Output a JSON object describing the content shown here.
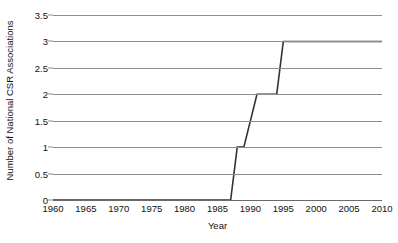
{
  "chart_data": {
    "type": "line",
    "title": "",
    "subtitle": "",
    "xlabel": "Year",
    "ylabel": "Number of National CSR Associations",
    "xlim": [
      1960,
      2010
    ],
    "ylim": [
      0,
      3.5
    ],
    "grid": true,
    "legend": null,
    "legend_position": "none",
    "step_style": "linear-segments",
    "xticks": [
      1960,
      1965,
      1970,
      1975,
      1980,
      1985,
      1990,
      1995,
      2000,
      2005,
      2010
    ],
    "xtick_labels": [
      "1960",
      "1965",
      "1970",
      "1975",
      "1980",
      "1985",
      "1990",
      "1995",
      "2000",
      "2005",
      "2010"
    ],
    "yticks": [
      0,
      0.5,
      1,
      1.5,
      2,
      2.5,
      3,
      3.5
    ],
    "ytick_labels": [
      "0",
      "0.5",
      "1",
      "1.5",
      "2",
      "2.5",
      "3",
      "3.5"
    ],
    "series_color": "#333333",
    "grid_color": "#8d8d8d",
    "x": [
      1960,
      1987,
      1988,
      1989,
      1991,
      1994,
      1995,
      2010
    ],
    "y": [
      0,
      0,
      1,
      1,
      2,
      2,
      3,
      3
    ],
    "points": [
      {
        "x": 1960,
        "y": 0
      },
      {
        "x": 1987,
        "y": 0
      },
      {
        "x": 1988,
        "y": 1
      },
      {
        "x": 1989,
        "y": 1
      },
      {
        "x": 1991,
        "y": 2
      },
      {
        "x": 1994,
        "y": 2
      },
      {
        "x": 1995,
        "y": 3
      },
      {
        "x": 2010,
        "y": 3
      }
    ],
    "annotations": []
  }
}
